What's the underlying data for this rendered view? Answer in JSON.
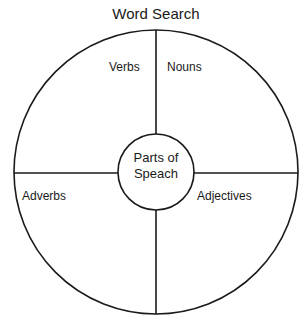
{
  "title": "Word Search",
  "center": {
    "line1": "Parts of",
    "line2": "Speach"
  },
  "quadrants": {
    "top_left": "Verbs",
    "top_right": "Nouns",
    "bottom_left": "Adverbs",
    "bottom_right": "Adjectives"
  },
  "colors": {
    "stroke": "#1a1a1a",
    "background": "#ffffff"
  }
}
